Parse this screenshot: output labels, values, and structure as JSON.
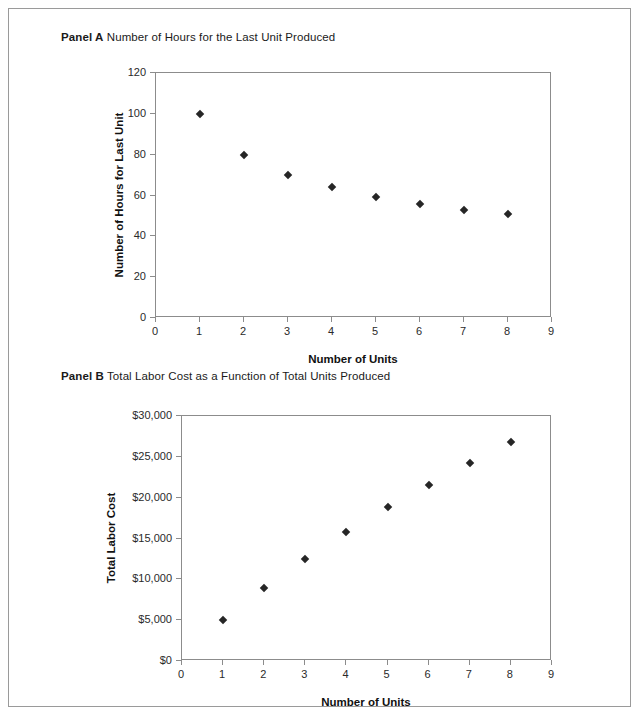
{
  "figure": {
    "panels": [
      {
        "id": "panel-a",
        "label": "Panel A",
        "title": "Number of Hours for the Last Unit Produced"
      },
      {
        "id": "panel-b",
        "label": "Panel B",
        "title": "Total Labor Cost as a Function of Total Units Produced"
      }
    ]
  },
  "chart_data": [
    {
      "type": "scatter",
      "title": "Number of Hours for the Last Unit Produced",
      "panel_label": "Panel A",
      "xlabel": "Number of Units",
      "ylabel": "Number of Hours for Last Unit",
      "x": [
        1,
        2,
        3,
        4,
        5,
        6,
        7,
        8
      ],
      "values": [
        100,
        80,
        70,
        64,
        59.5,
        56,
        53,
        51
      ],
      "xlim": [
        0,
        9
      ],
      "ylim": [
        0,
        120
      ],
      "xticks": [
        "0",
        "1",
        "2",
        "3",
        "4",
        "5",
        "6",
        "7",
        "8",
        "9"
      ],
      "xtick_values": [
        0,
        1,
        2,
        3,
        4,
        5,
        6,
        7,
        8,
        9
      ],
      "yticks": [
        "0",
        "20",
        "40",
        "60",
        "80",
        "100",
        "120"
      ],
      "ytick_values": [
        0,
        20,
        40,
        60,
        80,
        100,
        120
      ],
      "grid": false,
      "legend": false,
      "marker": "diamond",
      "marker_color": "#262626"
    },
    {
      "type": "scatter",
      "title": "Total Labor Cost as a Function of Total Units Produced",
      "panel_label": "Panel B",
      "xlabel": "Number of Units",
      "ylabel": "Total Labor Cost",
      "x": [
        1,
        2,
        3,
        4,
        5,
        6,
        7,
        8
      ],
      "values": [
        5000,
        9000,
        12500,
        15800,
        18800,
        21600,
        24200,
        26800
      ],
      "xlim": [
        0,
        9
      ],
      "ylim": [
        0,
        30000
      ],
      "xticks": [
        "0",
        "1",
        "2",
        "3",
        "4",
        "5",
        "6",
        "7",
        "8",
        "9"
      ],
      "xtick_values": [
        0,
        1,
        2,
        3,
        4,
        5,
        6,
        7,
        8,
        9
      ],
      "yticks": [
        "$0",
        "$5,000",
        "$10,000",
        "$15,000",
        "$20,000",
        "$25,000",
        "$30,000"
      ],
      "ytick_values": [
        0,
        5000,
        10000,
        15000,
        20000,
        25000,
        30000
      ],
      "grid": false,
      "legend": false,
      "marker": "diamond",
      "marker_color": "#262626"
    }
  ]
}
